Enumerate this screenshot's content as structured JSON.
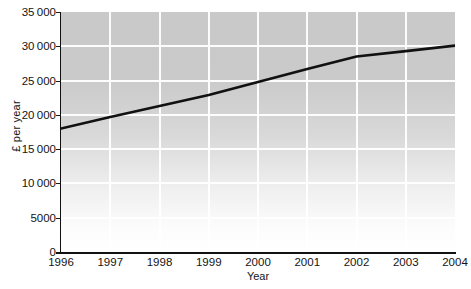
{
  "figure": {
    "background_color": "#ffffff",
    "plot_background_color": "#c9c9c9",
    "gridline_color": "#ffffff",
    "line_color": "#111111",
    "axis_color": "#111111"
  },
  "chart_data": {
    "type": "line",
    "title": "",
    "xlabel": "Year",
    "ylabel": "£ per year",
    "x": [
      1996,
      1997,
      1998,
      1999,
      2000,
      2001,
      2002,
      2003,
      2004
    ],
    "categories": [
      "1996",
      "1997",
      "1998",
      "1999",
      "2000",
      "2001",
      "2002",
      "2003",
      "2004"
    ],
    "values": [
      18000,
      19700,
      21300,
      22900,
      24800,
      26700,
      28500,
      29300,
      30100
    ],
    "series": [
      {
        "name": "£ per year",
        "values": [
          18000,
          19700,
          21300,
          22900,
          24800,
          26700,
          28500,
          29300,
          30100
        ]
      }
    ],
    "xlim": [
      1996,
      2004
    ],
    "ylim": [
      0,
      35000
    ],
    "ytick_values": [
      0,
      5000,
      10000,
      15000,
      20000,
      25000,
      30000,
      35000
    ],
    "ytick_labels": [
      "0",
      "5000",
      "10 000",
      "15 000",
      "20 000",
      "25 000",
      "30 000",
      "35 000"
    ],
    "xtick_labels": [
      "1996",
      "1997",
      "1998",
      "1999",
      "2000",
      "2001",
      "2002",
      "2003",
      "2004"
    ],
    "grid": true,
    "grid_axis": "both",
    "legend": false,
    "legend_position": "none",
    "annotations": []
  },
  "axes": {
    "y_title": "£ per year",
    "x_title": "Year"
  },
  "caption": {
    "sliver_text": ""
  }
}
